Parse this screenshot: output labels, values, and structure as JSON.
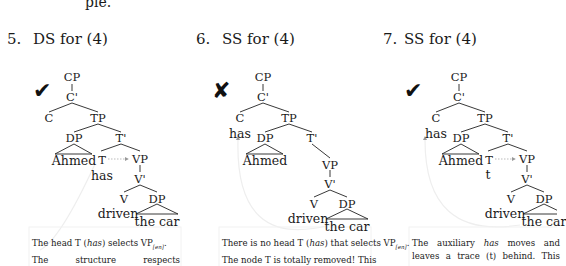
{
  "page": {
    "top_fragment": "ple."
  },
  "examples": [
    {
      "number": "5.",
      "title": "DS for (4)",
      "mark": "check",
      "mark_glyph": "✔",
      "nodes": {
        "cp": "CP",
        "cbar": "C'",
        "c": "C",
        "tp": "TP",
        "dp": "DP",
        "tbar": "T'",
        "t": "T",
        "vp": "VP",
        "vbar": "V'",
        "v": "V",
        "dp2": "DP"
      },
      "words": {
        "subject": "Ahmed",
        "aux": "has",
        "verb": "driven",
        "object": "the car"
      },
      "caption": {
        "line1_a": "The head T (",
        "line1_italic": "has",
        "line1_b": ") selects VP",
        "line1_sub": "[en]",
        "line1_end": ".",
        "line2": "The structure respects"
      }
    },
    {
      "number": "6.",
      "title": "SS for (4)",
      "mark": "cross",
      "mark_glyph": "✘",
      "nodes": {
        "cp": "CP",
        "cbar": "C'",
        "c": "C",
        "tp": "TP",
        "dp": "DP",
        "tbar": "T'",
        "vp": "VP",
        "vbar": "V'",
        "v": "V",
        "dp2": "DP"
      },
      "words": {
        "subject": "Ahmed",
        "aux": "has",
        "verb": "driven",
        "object": "the car"
      },
      "caption": {
        "line1_a": "There is no head T (",
        "line1_italic": "has",
        "line1_b": ") that selects VP",
        "line1_sub": "[en]",
        "line1_end": ".",
        "line2": "The node T is totally removed! This"
      }
    },
    {
      "number": "7.",
      "title": "SS for (4)",
      "mark": "check",
      "mark_glyph": "✔",
      "nodes": {
        "cp": "CP",
        "cbar": "C'",
        "c": "C",
        "tp": "TP",
        "dp": "DP",
        "tbar": "T'",
        "t": "T",
        "vp": "VP",
        "vbar": "V'",
        "v": "V",
        "dp2": "DP"
      },
      "words": {
        "subject": "Ahmed",
        "aux": "has",
        "trace": "t",
        "verb": "driven",
        "object": "the car"
      },
      "caption": {
        "line1_a": "The auxiliary ",
        "line1_italic": "has",
        "line1_b": " moves and",
        "line2": "leaves a trace (t) behind. This"
      }
    }
  ]
}
